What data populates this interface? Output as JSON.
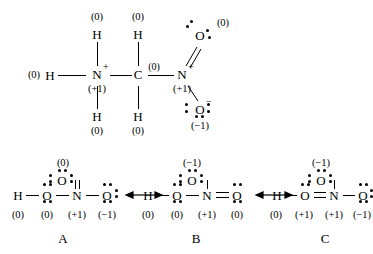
{
  "figure": {
    "type": "lewis-structure-resonance-diagram",
    "top_structure": {
      "name": "protonated-nitromethane-like-skeleton",
      "atoms": [
        {
          "id": "h-top-left",
          "symbol": "H",
          "charge": "(0)"
        },
        {
          "id": "h-top-mid",
          "symbol": "H",
          "charge": "(0)"
        },
        {
          "id": "h-left",
          "symbol": "H",
          "charge": "(0)"
        },
        {
          "id": "n-left",
          "symbol": "N",
          "superscript": "+",
          "charge": "(+1)"
        },
        {
          "id": "c-center",
          "symbol": "C",
          "charge": "(0)"
        },
        {
          "id": "n-right",
          "symbol": "N",
          "superscript": "+",
          "charge": "(+1)"
        },
        {
          "id": "o-upper-right",
          "symbol": "O",
          "charge": "(0)"
        },
        {
          "id": "o-lower-right",
          "symbol": "O",
          "superscript": "−",
          "charge": "(−1)"
        },
        {
          "id": "h-bottom-left",
          "symbol": "H",
          "charge": "(0)"
        },
        {
          "id": "h-bottom-mid",
          "symbol": "H",
          "charge": "(0)"
        }
      ]
    },
    "resonance_structures": [
      {
        "label": "A",
        "backbone": [
          "H",
          "O",
          "N",
          "O"
        ],
        "charges": [
          "(0)",
          "(0)",
          "(+1)",
          "(−1)"
        ],
        "top_atom": {
          "symbol": "O",
          "charge": "(0)",
          "bond": "double"
        },
        "right_bond": "single"
      },
      {
        "label": "B",
        "backbone": [
          "H",
          "O",
          "N",
          "O"
        ],
        "charges": [
          "(0)",
          "(0)",
          "(+1)",
          "(0)"
        ],
        "top_atom": {
          "symbol": "O",
          "charge": "(−1)",
          "bond": "single"
        },
        "right_bond": "double"
      },
      {
        "label": "C",
        "backbone": [
          "H",
          "O",
          "N",
          "O"
        ],
        "charges": [
          "(0)",
          "(+1)",
          "(+1)",
          "(−1)"
        ],
        "top_atom": {
          "symbol": "O",
          "charge": "(−1)",
          "bond": "single"
        },
        "right_bond": "single",
        "left_bond": "double"
      }
    ],
    "arrows": [
      {
        "id": "arrow-a-b",
        "kind": "resonance-double-headed"
      },
      {
        "id": "arrow-b-c",
        "kind": "resonance-double-headed"
      }
    ]
  }
}
